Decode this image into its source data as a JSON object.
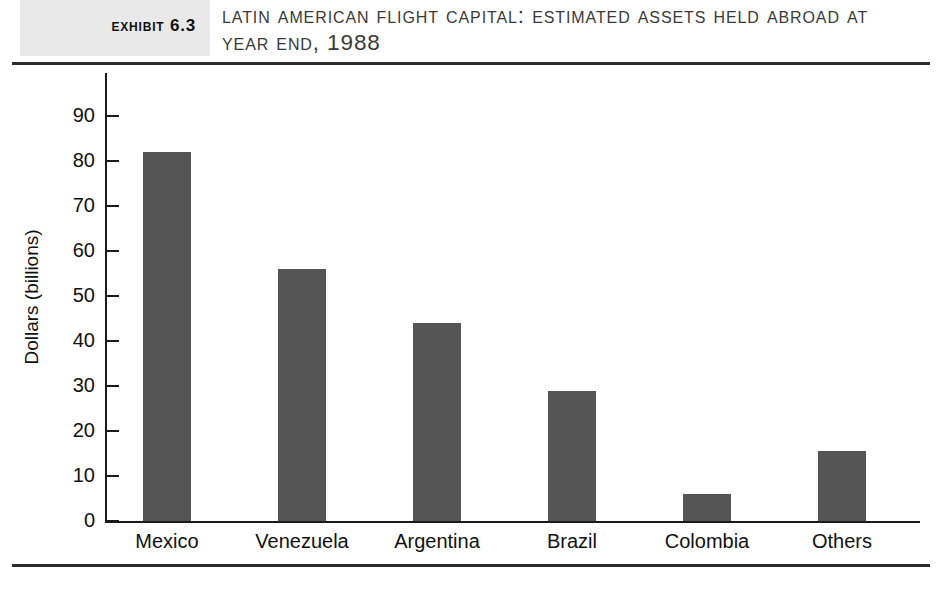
{
  "header": {
    "badge_label": "Exhibit 6.3",
    "title": "Latin American Flight Capital: Estimated Assets Held Abroad at Year End, 1988"
  },
  "chart_data": {
    "type": "bar",
    "title": "Latin American Flight Capital: Estimated Assets Held Abroad at Year End, 1988",
    "categories": [
      "Mexico",
      "Venezuela",
      "Argentina",
      "Brazil",
      "Colombia",
      "Others"
    ],
    "values": [
      82,
      56,
      44,
      29,
      6,
      15.5
    ],
    "xlabel": "",
    "ylabel": "Dollars (billions)",
    "ylim": [
      0,
      90
    ],
    "ytick_labels": [
      "90",
      "80",
      "70",
      "60",
      "50",
      "40",
      "30",
      "20",
      "10",
      "0"
    ],
    "ytick_values": [
      90,
      80,
      70,
      60,
      50,
      40,
      30,
      20,
      10,
      0
    ],
    "grid": false,
    "legend": "none",
    "bar_color": "#555555",
    "axis_color": "#1a1a1a"
  }
}
